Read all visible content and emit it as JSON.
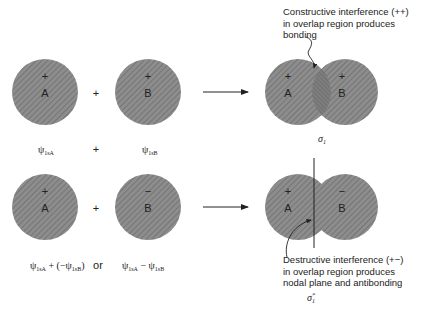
{
  "diagram": {
    "fill_color": "#8a8a8a",
    "hatch_color": "#6e6e6e",
    "line_color": "#222222",
    "top_row": {
      "orbital_A": {
        "label": "A",
        "sign": "+"
      },
      "orbital_B": {
        "label": "B",
        "sign": "+"
      },
      "operator": "+",
      "result": {
        "left_label": "A",
        "left_sign": "+",
        "right_label": "B",
        "right_sign": "+",
        "name": "σ₁"
      },
      "equation": {
        "term_a": "ψ1sA",
        "operator": "+",
        "term_b": "ψ1sB"
      },
      "annotation": [
        "Constructive interference (++)",
        "in overlap region produces",
        "bonding"
      ]
    },
    "bottom_row": {
      "orbital_A": {
        "label": "A",
        "sign": "+"
      },
      "orbital_B": {
        "label": "B",
        "sign": "−"
      },
      "operator": "+",
      "result": {
        "left_label": "A",
        "left_sign": "+",
        "right_label": "B",
        "right_sign": "−",
        "name": "σ₁*"
      },
      "equation": {
        "expr_1": "ψ1sA + (−ψ1sB)",
        "connector": "or",
        "expr_2": "ψ1sA − ψ1sB"
      },
      "annotation": [
        "Destructive interference (+−)",
        "in overlap region produces",
        "nodal plane and antibonding"
      ]
    }
  }
}
